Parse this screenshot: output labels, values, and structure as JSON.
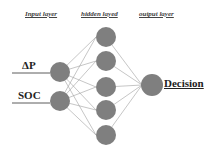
{
  "headers": {
    "input": "Input layer",
    "hidden": "hidden layed",
    "output": "output layer"
  },
  "inputs": [
    {
      "label": "ΔP"
    },
    {
      "label": "SOC"
    }
  ],
  "hidden_count": 5,
  "output": {
    "label": "Decision"
  },
  "colors": {
    "node": "#7f7f7f",
    "edge": "#9a9a9a",
    "line": "#333333"
  }
}
